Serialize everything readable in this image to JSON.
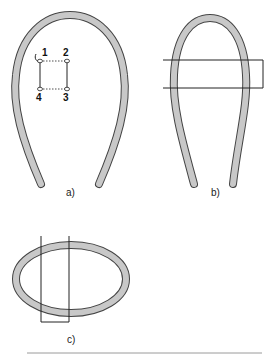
{
  "figure": {
    "panels": [
      {
        "id": "a",
        "label": "a)",
        "description": "Horseshoe loop with four numbered points forming a square"
      },
      {
        "id": "b",
        "label": "b)",
        "description": "Horseshoe loop crossed by a horizontal rectangular band"
      },
      {
        "id": "c",
        "label": "c)",
        "description": "Elliptical ring crossed by a vertical rectangular band"
      }
    ],
    "points": [
      {
        "label": "1"
      },
      {
        "label": "2"
      },
      {
        "label": "3"
      },
      {
        "label": "4"
      }
    ],
    "colors": {
      "ring_fill": "#c8c8c8",
      "ring_stroke": "#444444",
      "line": "#222222",
      "rule": "#9a9a9a"
    }
  }
}
